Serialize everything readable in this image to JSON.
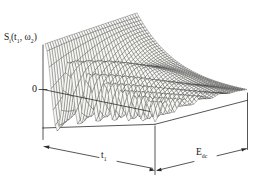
{
  "figure": {
    "signal_label_parts": {
      "p1": "S",
      "s1": "i",
      "p2": "(t",
      "s2": "1",
      "p3": ", ω",
      "s3": "2",
      "p4": ")"
    },
    "zero_label": "0",
    "t1_label_parts": {
      "base": "t",
      "sub": "1"
    },
    "edc_label_parts": {
      "base": "E",
      "sub": "dc"
    }
  },
  "chart_data": {
    "type": "line",
    "subtype": "3d-hidden-line-mesh-surface",
    "title": "",
    "zlabel": "S_i(t_1, ω_2)",
    "xlabel": "t_1",
    "ylabel": "E_dc",
    "zero_reference_label": "0",
    "axis_numeric_ticks": "none (schematic axes, dimension arrows only)",
    "x_fraction": [
      0,
      0.1,
      0.2,
      0.3,
      0.4,
      0.5,
      0.6,
      0.7,
      0.8,
      0.9,
      1.0
    ],
    "series": [
      {
        "name": "front edge (E_dc = 0), normalized S",
        "values": [
          1.0,
          -0.8,
          0.67,
          -0.61,
          0.51,
          -0.21,
          -0.23,
          0.31,
          0.14,
          -0.15,
          -0.21
        ]
      },
      {
        "name": "back edge (E_dc = max), normalized S",
        "values": [
          1.0,
          0.76,
          0.57,
          0.43,
          0.33,
          0.25,
          0.19,
          0.14,
          0.11,
          0.08,
          0.06
        ]
      }
    ],
    "front_edge_minima_t1_fraction": [
      0.11,
      0.31,
      0.48,
      0.63,
      0.76,
      0.88,
      0.99
    ],
    "render": {
      "bg": "#ffffff",
      "mesh_fill": "#f7f7f3",
      "mesh_stroke": "#3c3c3c",
      "line_color": "#2b2b2b",
      "origin": [
        45,
        127.8
      ],
      "tvec": [
        110,
        -3.5
      ],
      "evec": [
        92,
        -24
      ],
      "nt": 54,
      "ne": 38,
      "model": {
        "amp0": 46,
        "ampE": 24,
        "k0": 1.55,
        "kE": 1.25,
        "zero0": 38,
        "zeroT": -26,
        "zeroE": 0.45,
        "n1": 4.2,
        "n2": 2.3,
        "chirpE": 0.75,
        "oscPow": 1.3
      },
      "box_lines": [
        [
          43,
          128,
          155,
          124.3
        ],
        [
          155,
          124.3,
          247.5,
          100.3
        ],
        [
          247.5,
          93,
          247.5,
          149.5
        ],
        [
          43,
          128,
          43,
          139.5
        ],
        [
          155,
          126,
          155,
          174.5
        ]
      ],
      "top_lines": [
        [
          43,
          45,
          43,
          128
        ],
        [
          39,
          89.5,
          47,
          89.5
        ],
        [
          43,
          89.5,
          150,
          111.5
        ]
      ],
      "dim_segments": [
        [
          44,
          146.5,
          99,
          157.5
        ],
        [
          117,
          161.3,
          152.5,
          168.3
        ],
        [
          157.5,
          170.3,
          194,
          161.5
        ],
        [
          217,
          155.8,
          246.5,
          148.7
        ]
      ],
      "arrows": [
        {
          "tip": [
            43.8,
            146.2
          ],
          "dir": [
            -110,
            -22
          ]
        },
        {
          "tip": [
            155,
            170.6
          ],
          "dir": [
            110,
            22
          ]
        },
        {
          "tip": [
            156,
            170.8
          ],
          "dir": [
            -89,
            21.6
          ]
        },
        {
          "tip": [
            247,
            148.6
          ],
          "dir": [
            89,
            -21.6
          ]
        }
      ]
    }
  }
}
